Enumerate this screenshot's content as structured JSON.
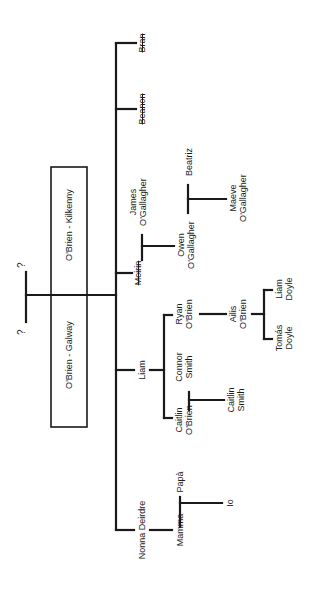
{
  "diagram": {
    "type": "family-tree",
    "orientation": "rotated-90-ccw",
    "colors": {
      "line": "#1a1a1a",
      "background": "#ffffff"
    },
    "ancestors": {
      "left": "?",
      "right": "?"
    },
    "branches": {
      "kilkenny": "O'Brien - Kilkenny",
      "galway": "O'Brien - Galway"
    },
    "people": {
      "bran": "Bran",
      "beanon": "Beanon",
      "moirin": "Moirin",
      "james": {
        "first": "James",
        "last": "O'Gallagher"
      },
      "owen": {
        "first": "Owen",
        "last": "O'Gallagher"
      },
      "beatriz": "Beatriz",
      "maeve": {
        "first": "Maeve",
        "last": "O'Gallagher"
      },
      "liam": "Liam",
      "ryan": {
        "first": "Ryan",
        "last": "O'Brien"
      },
      "ailis": {
        "first": "Ailis",
        "last": "O'Brien"
      },
      "liam_doyle": {
        "first": "Liam",
        "last": "Doyle"
      },
      "tomas_doyle": {
        "first": "Tomás",
        "last": "Doyle"
      },
      "connor": {
        "first": "Connor",
        "last": "Smith"
      },
      "caitlin_obrien": {
        "first": "Caitlin",
        "last": "O'Brien"
      },
      "caitlin_smith": {
        "first": "Caitlin",
        "last": "Smith"
      },
      "nonna": "Nonna Deirdre",
      "mamma": "Mamma",
      "papa": "Papà",
      "io": "Io"
    },
    "struck_names": [
      "Bran",
      "Beanon",
      "Moirin"
    ]
  }
}
